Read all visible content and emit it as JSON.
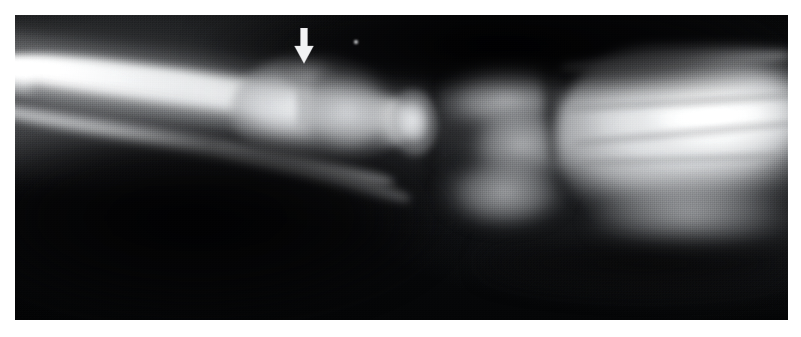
{
  "figure": {
    "kind": "radiograph",
    "modality": "X-ray",
    "view": "lateral",
    "body_part": "wrist and distal forearm",
    "page_background": "#ffffff",
    "plate": {
      "x": 15,
      "y": 15,
      "width": 773,
      "height": 305,
      "background_color": "#08090a",
      "border_color": "#ffffff"
    }
  },
  "annotations": [
    {
      "id": "arrow-marker",
      "name": "arrow-marker",
      "type": "arrow",
      "direction": "down",
      "color": "#f2f3f4",
      "x": 293,
      "y": 28,
      "width": 22,
      "height": 36,
      "tip_x": 304,
      "tip_y": 64,
      "points_at": "dorsal cortical buckle of the distal radius",
      "label": ""
    },
    {
      "id": "dust-speck",
      "name": "film-artifact-speck",
      "type": "speck",
      "color": "#cdcfd2",
      "x": 354,
      "y": 40,
      "width": 4,
      "height": 4,
      "label": ""
    }
  ],
  "anatomy_regions": [
    {
      "id": "shaft-bright",
      "name": "radius-ulna-shaft",
      "label": "radial / ulnar shaft"
    },
    {
      "id": "shaft-second",
      "name": "ulnar-cortex",
      "label": "second cortical line"
    },
    {
      "id": "metaphysis",
      "name": "distal-metaphysis",
      "label": "distal radial metaphysis"
    },
    {
      "id": "buckle-bulge",
      "name": "buckle-fracture-bulge",
      "label": "dorsal cortical buckle"
    },
    {
      "id": "epiphysis",
      "name": "distal-epiphysis",
      "label": "distal epiphysis"
    },
    {
      "id": "pisiform",
      "name": "pisiform-bone",
      "label": "pisiform"
    },
    {
      "id": "carpal-upper",
      "name": "carpal-row-proximal",
      "label": "proximal carpal row"
    },
    {
      "id": "carpal-mid",
      "name": "carpal-row-distal",
      "label": "distal carpal row"
    },
    {
      "id": "hand-mass",
      "name": "metacarpal-bases",
      "label": "metacarpal bases"
    },
    {
      "id": "volar-dark",
      "name": "volar-soft-tissue",
      "label": "volar soft tissue"
    },
    {
      "id": "dorsal-dark",
      "name": "dorsal-air-gap",
      "label": "dorsal background"
    }
  ],
  "palette": {
    "page": "#ffffff",
    "film_black": "#08090a",
    "bone_bright": "#ffffff",
    "bone_mid": "#c8cacd",
    "soft_tissue": "#6e7073",
    "marker_white": "#f2f3f4"
  }
}
